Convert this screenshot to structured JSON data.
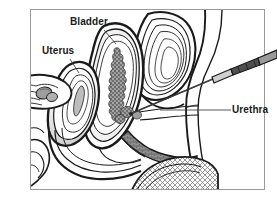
{
  "figure": {
    "type": "medical-line-illustration",
    "frame_color": "#9a9a9a",
    "background_color": "#ffffff",
    "ink_color": "#1a1a1a",
    "shade_gray": "#9b9b9b",
    "shade_light": "#d9d9d9",
    "shade_mid": "#b5b5b5"
  },
  "labels": {
    "bladder": "Bladder",
    "uterus": "Uterus",
    "urethra": "Urethra"
  },
  "structures": {
    "bladder_name": "bladder",
    "uterus_name": "uterus",
    "urethra_name": "urethra",
    "ovary_name": "ovary-adnexa",
    "rectum_name": "rectum",
    "pubic_bone_name": "pubic-bone",
    "lesion_name": "bladder-lesion-stippled",
    "instrument_name": "cystoscope-needle"
  }
}
